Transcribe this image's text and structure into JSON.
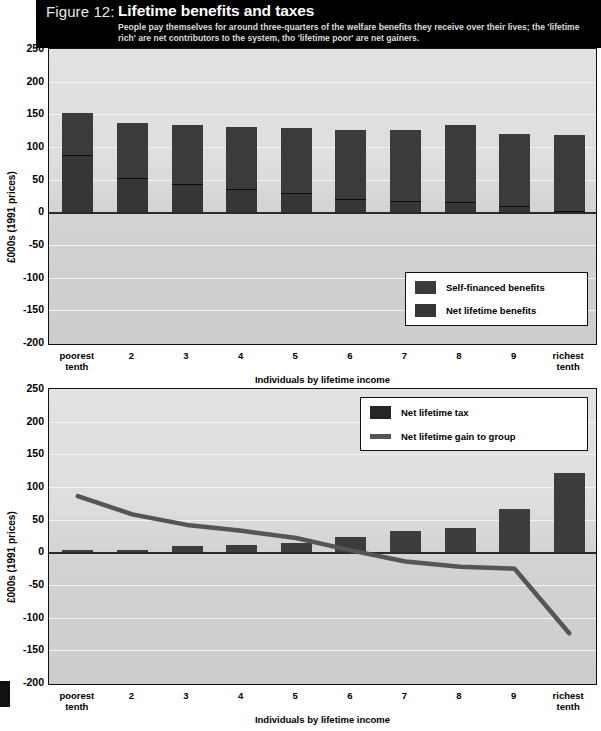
{
  "figure": {
    "number_label": "Figure 12:",
    "title": "Lifetime benefits and taxes",
    "subtitle": "People pay themselves for  around three-quarters of the welfare benefits they receive over their lives; the 'lifetime rich' are net contributors to the system, tho 'lifetime poor' are net gainers."
  },
  "colors": {
    "banner_bg": "#000000",
    "plot_bg": "#d8d8d8",
    "bar_dark": "#3b3b3b",
    "bar_light": "#363636",
    "line": "#555555",
    "gridline": "#f3f3f3",
    "axis": "#111111"
  },
  "common": {
    "ylabel": "£000s (1991 prices)",
    "xlabel": "Individuals by lifetime income",
    "categories": [
      "poorest\ntenth",
      "2",
      "3",
      "4",
      "5",
      "6",
      "7",
      "8",
      "9",
      "richest\ntenth"
    ],
    "category_lines": [
      [
        "poorest",
        "tenth"
      ],
      [
        "2",
        ""
      ],
      [
        "3",
        ""
      ],
      [
        "4",
        ""
      ],
      [
        "5",
        ""
      ],
      [
        "6",
        ""
      ],
      [
        "7",
        ""
      ],
      [
        "8",
        ""
      ],
      [
        "9",
        ""
      ],
      [
        "richest",
        "tenth"
      ]
    ],
    "yticks": [
      "250",
      "200",
      "150",
      "100",
      "50",
      "0",
      "-50",
      "-100",
      "-150",
      "-200"
    ],
    "ytick_values": [
      250,
      200,
      150,
      100,
      50,
      0,
      -50,
      -100,
      -150,
      -200
    ]
  },
  "chart_data": [
    {
      "id": "chart-top",
      "type": "bar",
      "stacked": true,
      "title": "Lifetime benefits and taxes",
      "xlabel": "Individuals by lifetime income",
      "ylabel": "£000s (1991 prices)",
      "ylim": [
        -200,
        250
      ],
      "ytick_step": 50,
      "grid": true,
      "legend_position": "inside-bottom-right",
      "categories": [
        "poorest tenth",
        "2",
        "3",
        "4",
        "5",
        "6",
        "7",
        "8",
        "9",
        "richest tenth"
      ],
      "series": [
        {
          "name": "Net lifetime benefits",
          "legend_label": "Net lifetime benefits",
          "values": [
            87,
            53,
            43,
            35,
            30,
            21,
            17,
            16,
            9,
            2
          ]
        },
        {
          "name": "Self-financed benefits",
          "legend_label": "Self-financed benefits",
          "values": [
            65,
            84,
            90,
            95,
            99,
            105,
            109,
            117,
            111,
            117
          ]
        }
      ],
      "totals": [
        152,
        137,
        133,
        130,
        129,
        126,
        126,
        133,
        120,
        119
      ]
    },
    {
      "id": "chart-bottom",
      "type": "bar+line",
      "xlabel": "Individuals by lifetime income",
      "ylabel": "£000s (1991 prices)",
      "ylim": [
        -200,
        250
      ],
      "ytick_step": 50,
      "grid": true,
      "legend_position": "inside-top-right",
      "categories": [
        "poorest tenth",
        "2",
        "3",
        "4",
        "5",
        "6",
        "7",
        "8",
        "9",
        "richest tenth"
      ],
      "series": [
        {
          "name": "Net lifetime tax",
          "legend_label": "Net lifetime tax",
          "type": "bar",
          "values": [
            1,
            2,
            9,
            11,
            15,
            24,
            32,
            37,
            67,
            121
          ]
        },
        {
          "name": "Net lifetime gain to group",
          "legend_label": "Net lifetime gain to group",
          "type": "line",
          "values": [
            86,
            58,
            42,
            33,
            22,
            3,
            -14,
            -22,
            -25,
            -124
          ]
        }
      ]
    }
  ]
}
